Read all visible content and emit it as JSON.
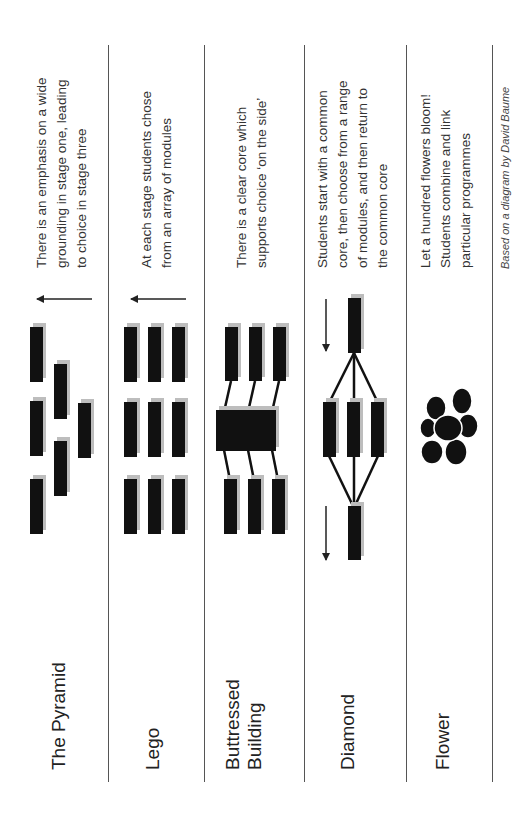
{
  "footer": {
    "credit": "Based on a diagram by David Baume"
  },
  "models": [
    {
      "title_lines": [
        "The Pyramid"
      ],
      "description_lines": [
        "There is an emphasis on a wide",
        "grounding in stage one, leading",
        "to choice in stage three"
      ],
      "arrow": "left"
    },
    {
      "title_lines": [
        "Lego"
      ],
      "description_lines": [
        "At each stage students chose",
        "from an array of modules"
      ],
      "arrow": "left"
    },
    {
      "title_lines": [
        "Buttressed",
        "Building"
      ],
      "description_lines": [
        "There is a clear core which",
        "supports choice ‘on the side’"
      ],
      "arrow": "none"
    },
    {
      "title_lines": [
        "Diamond"
      ],
      "description_lines": [
        "Students start with a common",
        "core, then choose from a range",
        "of modules, and then return to",
        "the common core"
      ],
      "arrow": "down"
    },
    {
      "title_lines": [
        "Flower"
      ],
      "description_lines": [
        "Let a hundred flowers bloom!",
        "Students combine and link",
        "particular programmes"
      ],
      "arrow": "none"
    }
  ],
  "colors": {
    "block": "#111111",
    "shadow": "#bdbdbd",
    "divider": "#555555",
    "text": "#222222"
  }
}
